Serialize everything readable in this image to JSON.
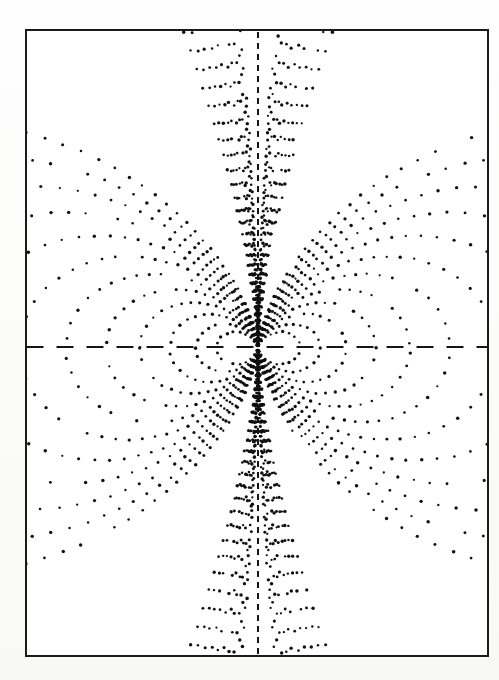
{
  "figure": {
    "kind": "dipole-field-line-stipple-plot",
    "caption": "",
    "title": "",
    "background_color": "#fdfdfd",
    "paper_color": "#ffffff",
    "ink_color": "#101010",
    "frame": {
      "x": 25,
      "y": 29,
      "width": 464,
      "height": 628,
      "border_width": 2,
      "border_color": "#1b1b1b"
    },
    "origin": {
      "x": 258,
      "y": 348
    },
    "axes": {
      "horizontal": {
        "label": "",
        "y": 347,
        "style": "dashed",
        "dash_length": 17,
        "gap_length": 13,
        "line_width": 2,
        "color": "#141414"
      },
      "vertical": {
        "label": "",
        "x": 258,
        "style": "dashed",
        "dash_length": 6,
        "gap_length": 5,
        "line_width": 2,
        "color": "#141414"
      }
    },
    "dot": {
      "radius": 1.35,
      "min_spacing_px": 5.0,
      "max_spacing_px": 19.0,
      "spacing_growth": 0.055,
      "jitter_px": 1.1
    }
  },
  "chart_data": {
    "type": "scatter",
    "title": "",
    "subtitle": "",
    "xlabel": "",
    "ylabel": "",
    "legend": [],
    "grid": false,
    "annotations": [],
    "xlim": [
      -258,
      231
    ],
    "ylim": [
      -309,
      319
    ],
    "field_model": {
      "equation": "r = L * sin(theta)^2",
      "L_parameter_name": "L",
      "units": "pixels",
      "symmetry": [
        "mirror-x",
        "mirror-y"
      ]
    },
    "closed_loops_L": [
      42,
      62,
      88,
      118,
      152,
      192,
      238,
      292,
      352,
      420,
      498,
      590
    ],
    "open_lines_theta_deg": [
      4,
      7,
      10,
      13.5,
      17,
      21,
      25,
      29.5,
      34,
      39
    ],
    "axis_tick_labels": {
      "x": [],
      "y": []
    },
    "series": [
      {
        "name": "dipole-field-lines",
        "marker": "dot",
        "color": "#101010",
        "n_lines": 44
      }
    ]
  }
}
